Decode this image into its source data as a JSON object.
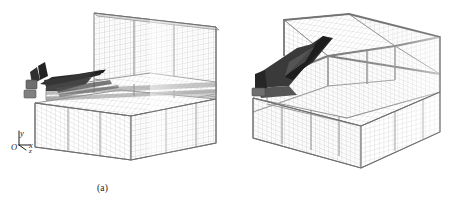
{
  "figure": {
    "background_color": "#ffffff",
    "width": 453,
    "height": 209,
    "kind": "scientific-figure"
  },
  "panels": [
    {
      "id": "a",
      "caption": "(a)",
      "axes": {
        "origin": "O",
        "y": "y",
        "x": "x",
        "z": "z"
      },
      "view": "side-quarter view showing grid box and aircraft near left wall",
      "mesh_color": "#9a9a9a",
      "model_color": "#2b2b2b"
    },
    {
      "id": "b",
      "caption": "(b)",
      "axes": {
        "origin": "O",
        "y": "y",
        "x": "x",
        "z": "z"
      },
      "view": "oblique view along the tunnel axis showing converging grid blocks",
      "mesh_color": "#9a9a9a",
      "model_color": "#2b2b2b"
    }
  ],
  "colors": {
    "background": "#ffffff",
    "mesh_fine": "#b4b4b4",
    "mesh_block_edge": "#8c8c8c",
    "mesh_outline": "#707070",
    "model_dark": "#262626",
    "model_mid": "#4a4a4a",
    "text": "#1a1a1a"
  }
}
